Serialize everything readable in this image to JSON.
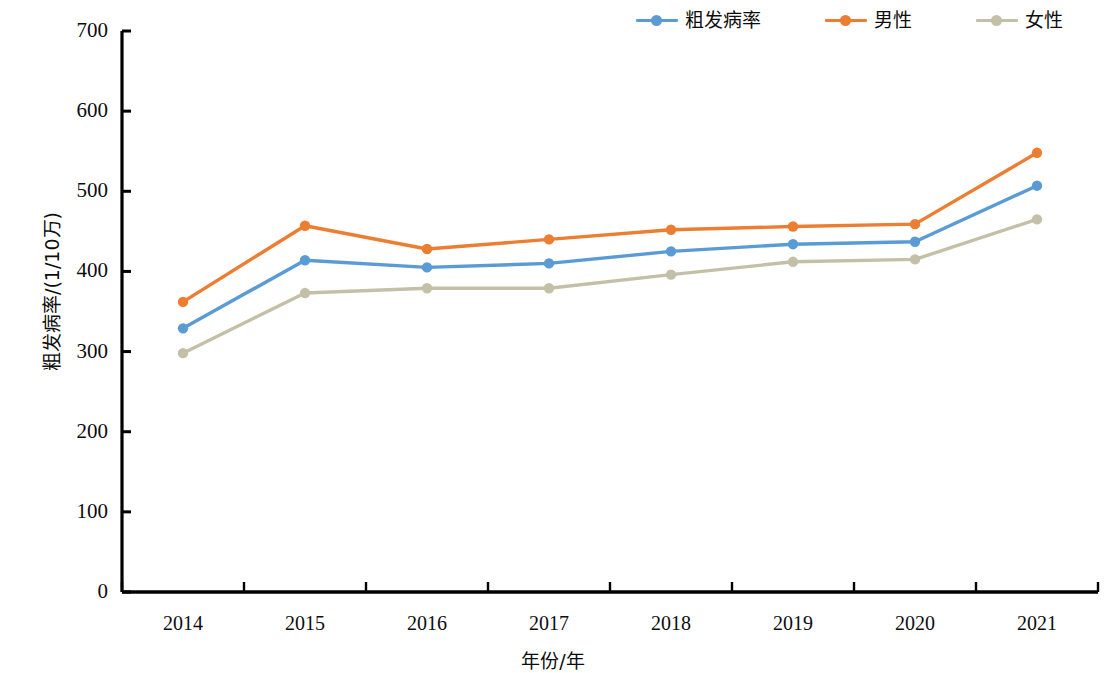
{
  "chart_data": {
    "type": "line",
    "title": "",
    "xlabel": "年份/年",
    "ylabel": "粗发病率/(1/10万)",
    "categories": [
      "2014",
      "2015",
      "2016",
      "2017",
      "2018",
      "2019",
      "2020",
      "2021"
    ],
    "x": [
      2014,
      2015,
      2016,
      2017,
      2018,
      2019,
      2020,
      2021
    ],
    "ylim": [
      0,
      700
    ],
    "ytick_labels": [
      "0",
      "100",
      "200",
      "300",
      "400",
      "500",
      "600",
      "700"
    ],
    "ytick_values": [
      0,
      100,
      200,
      300,
      400,
      500,
      600,
      700
    ],
    "grid": false,
    "legend_position": "top-right",
    "series": [
      {
        "name": "粗发病率",
        "color": "#5b9bd5",
        "values": [
          329,
          414,
          405,
          410,
          425,
          434,
          437,
          507
        ]
      },
      {
        "name": "男性",
        "color": "#ed7d31",
        "values": [
          362,
          457,
          428,
          440,
          452,
          456,
          459,
          548
        ]
      },
      {
        "name": "女性",
        "color": "#c4c0a8",
        "values": [
          298,
          373,
          379,
          379,
          396,
          412,
          415,
          465
        ]
      }
    ]
  },
  "legend": {
    "items": [
      {
        "label": "粗发病率",
        "color": "#5b9bd5"
      },
      {
        "label": "男性",
        "color": "#ed7d31"
      },
      {
        "label": "女性",
        "color": "#c4c0a8"
      }
    ]
  },
  "axes": {
    "y_title": "粗发病率/(1/10万)",
    "x_title": "年份/年",
    "y_ticks": [
      "700",
      "600",
      "500",
      "400",
      "300",
      "200",
      "100",
      "0"
    ],
    "x_ticks": [
      "2014",
      "2015",
      "2016",
      "2017",
      "2018",
      "2019",
      "2020",
      "2021"
    ],
    "axis_color": "#000000"
  }
}
